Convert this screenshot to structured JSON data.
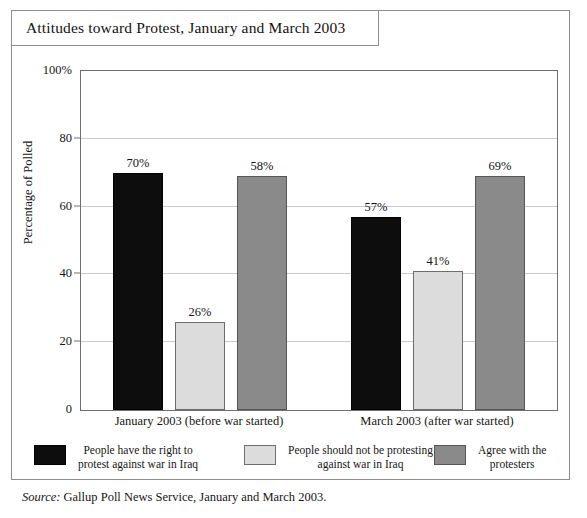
{
  "figure": {
    "title": "Attitudes toward Protest, January and March 2003",
    "source_label": "Source:",
    "source_text": " Gallup Poll News Service,  January and March 2003."
  },
  "chart_data": {
    "type": "bar",
    "title": "Attitudes toward Protest, January and March 2003",
    "xlabel": "",
    "ylabel": "Percentage of Polled",
    "ylim": [
      0,
      100
    ],
    "yticks": [
      0,
      20,
      40,
      60,
      80,
      100
    ],
    "ytick_labels": [
      "0",
      "20",
      "40",
      "60",
      "80",
      "100%"
    ],
    "grid": true,
    "legend_position": "bottom",
    "categories": [
      "January 2003 (before war started)",
      "March 2003 (after war started)"
    ],
    "series": [
      {
        "name": "People have the right to\nprotest against war in Iraq",
        "color": "#0d0d0d",
        "values": [
          70,
          57
        ],
        "value_labels": [
          "70%",
          "57%"
        ]
      },
      {
        "name": "People should not be protesting\nagainst war in Iraq",
        "color": "#dcdcdc",
        "values": [
          26,
          41
        ],
        "value_labels": [
          "26%",
          "41%"
        ]
      },
      {
        "name": "Agree with the\nprotesters",
        "color": "#8a8a8a",
        "values": [
          69,
          69
        ],
        "value_labels": [
          "58%",
          "69%"
        ]
      }
    ]
  },
  "colors": {
    "frame": "#8e8e8e",
    "axis": "#6f6f6f",
    "gridline": "#c9c9c9",
    "text": "#161616"
  }
}
